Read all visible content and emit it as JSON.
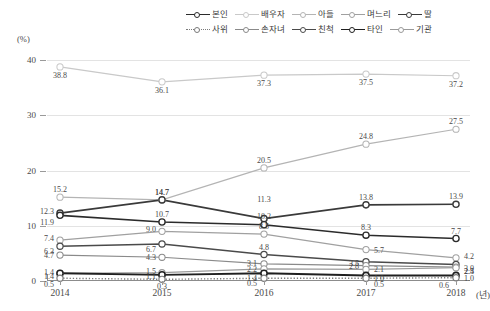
{
  "axis": {
    "y_unit": "(%)",
    "y_ticks": [
      "0",
      "10",
      "20",
      "30",
      "40"
    ],
    "x_unit": "(년)",
    "x_ticks": [
      "2014",
      "2015",
      "2016",
      "2017",
      "2018"
    ]
  },
  "legend": {
    "row1": [
      {
        "label": "본인",
        "color": "#2b2b2b",
        "style": "solid",
        "weight": "1.6"
      },
      {
        "label": "배우자",
        "color": "#c9c9c9",
        "style": "solid",
        "weight": "1.2"
      },
      {
        "label": "아들",
        "color": "#b4b4b4",
        "style": "solid",
        "weight": "1.2"
      },
      {
        "label": "며느리",
        "color": "#a0a0a0",
        "style": "solid",
        "weight": "1.2"
      },
      {
        "label": "딸",
        "color": "#3a3a3a",
        "style": "solid",
        "weight": "1.6"
      }
    ],
    "row2": [
      {
        "label": "사위",
        "color": "#7a7a7a",
        "style": "dotted",
        "weight": "1.4"
      },
      {
        "label": "손자녀",
        "color": "#8a8a8a",
        "style": "solid",
        "weight": "1.2"
      },
      {
        "label": "친척",
        "color": "#4a4a4a",
        "style": "solid",
        "weight": "1.4"
      },
      {
        "label": "타인",
        "color": "#1f1f1f",
        "style": "solid",
        "weight": "1.8"
      },
      {
        "label": "기관",
        "color": "#9a9a9a",
        "style": "solid",
        "weight": "1.2"
      }
    ]
  },
  "chart_data": {
    "type": "line",
    "title": "",
    "xlabel": "(년)",
    "ylabel": "(%)",
    "grid": true,
    "legend_position": "top-right",
    "x": [
      "2014",
      "2015",
      "2016",
      "2017",
      "2018"
    ],
    "ylim": [
      0,
      41.5
    ],
    "yticks": [
      0,
      10,
      20,
      30,
      40
    ],
    "series": [
      {
        "name": "배우자",
        "color": "#c9c9c9",
        "values": [
          38.8,
          36.1,
          37.3,
          37.5,
          37.2
        ],
        "labels": [
          "38.8",
          "36.1",
          "37.3",
          "37.5",
          "37.2"
        ]
      },
      {
        "name": "아들",
        "color": "#b4b4b4",
        "values": [
          15.2,
          14.7,
          20.5,
          24.8,
          27.5
        ],
        "labels": [
          "15.2",
          "14.7",
          "20.5",
          "24.8",
          "27.5"
        ]
      },
      {
        "name": "딸",
        "color": "#3a3a3a",
        "values": [
          12.3,
          14.7,
          11.3,
          13.8,
          13.9
        ],
        "labels": [
          "12.3",
          "14.7",
          "11.3",
          "13.8",
          "13.9"
        ]
      },
      {
        "name": "본인",
        "color": "#2b2b2b",
        "values": [
          11.9,
          10.7,
          10.2,
          8.3,
          7.7
        ],
        "labels": [
          "11.9",
          "10.7",
          "10.2",
          "8.3",
          "7.7"
        ]
      },
      {
        "name": "며느리",
        "color": "#a0a0a0",
        "values": [
          7.4,
          9.0,
          8.5,
          5.7,
          4.2
        ],
        "labels": [
          "7.4",
          "9.0",
          "8.5",
          "5.7",
          "4.2"
        ]
      },
      {
        "name": "친척",
        "color": "#4a4a4a",
        "values": [
          6.3,
          6.7,
          4.8,
          3.5,
          3.0
        ],
        "labels": [
          "6.3",
          "6.7",
          "4.8",
          "3.5",
          "3.0"
        ]
      },
      {
        "name": "손자녀",
        "color": "#8a8a8a",
        "values": [
          4.7,
          4.3,
          3.1,
          2.8,
          2.5
        ],
        "labels": [
          "4.7",
          "4.3",
          "3.1",
          "2.8",
          "2.5"
        ]
      },
      {
        "name": "기관",
        "color": "#9a9a9a",
        "values": [
          1.4,
          1.5,
          2.2,
          2.1,
          2.4
        ],
        "labels": [
          "1.4",
          "1.5",
          "2.2",
          "2.1",
          "2.4"
        ]
      },
      {
        "name": "타인",
        "color": "#1f1f1f",
        "values": [
          1.4,
          1.1,
          1.4,
          1.0,
          1.0
        ],
        "labels": [
          "1.4",
          "1.1",
          "1.4",
          "1.0",
          "1.0"
        ]
      },
      {
        "name": "사위",
        "color": "#7a7a7a",
        "values": [
          0.5,
          0.3,
          0.5,
          0.5,
          0.6
        ],
        "labels": [
          "0.5",
          "0.3",
          "0.5",
          "0.5",
          "0.6"
        ]
      }
    ]
  }
}
